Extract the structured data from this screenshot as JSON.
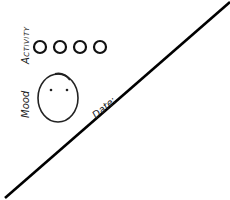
{
  "sheet": {
    "activity": {
      "label": "Activity",
      "circles": [
        {
          "cx": 40,
          "cy": 47,
          "r": 6
        },
        {
          "cx": 60,
          "cy": 47,
          "r": 6
        },
        {
          "cx": 80,
          "cy": 47,
          "r": 6
        },
        {
          "cx": 100,
          "cy": 47,
          "r": 6
        }
      ]
    },
    "mood": {
      "label": "Mood",
      "face": {
        "cx": 58,
        "cy": 97,
        "rx": 20,
        "ry": 24
      }
    },
    "date": {
      "label": "Date:"
    },
    "divider": {
      "x1": 230,
      "y1": 2,
      "x2": 5,
      "y2": 198
    },
    "colors": {
      "ink": "#111111",
      "paper": "#ffffff"
    }
  }
}
